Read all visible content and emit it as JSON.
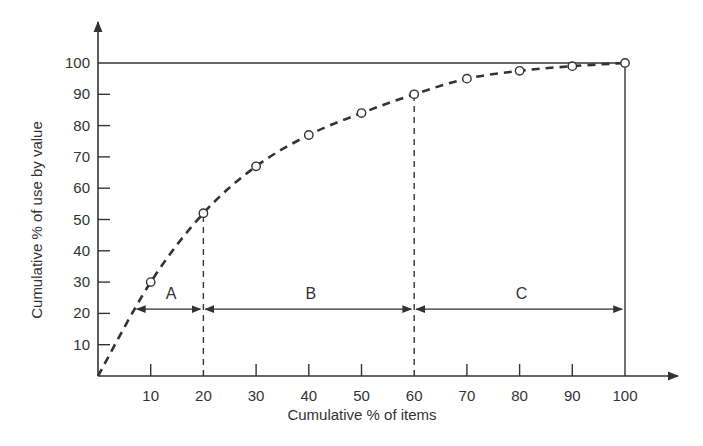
{
  "chart_data": {
    "type": "line",
    "title": "",
    "xlabel": "Cumulative % of items",
    "ylabel": "Cumulative % of use by value",
    "xlim": [
      0,
      100
    ],
    "ylim": [
      0,
      100
    ],
    "grid": false,
    "legend": null,
    "x_ticks": [
      10,
      20,
      30,
      40,
      50,
      60,
      70,
      80,
      90,
      100
    ],
    "y_ticks": [
      10,
      20,
      30,
      40,
      50,
      60,
      70,
      80,
      90,
      100
    ],
    "series": [
      {
        "name": "ABC cumulative curve",
        "style": "dashed with open circle markers",
        "x": [
          10,
          20,
          30,
          40,
          50,
          60,
          70,
          80,
          90,
          100
        ],
        "y": [
          30,
          52,
          67,
          77,
          84,
          90,
          95,
          97.5,
          99,
          100
        ]
      }
    ],
    "reference_lines": [
      {
        "type": "horizontal",
        "y": 100,
        "x_range": [
          0,
          100
        ],
        "style": "solid"
      },
      {
        "type": "vertical",
        "x": 100,
        "y_range": [
          0,
          100
        ],
        "style": "solid"
      },
      {
        "type": "vertical",
        "x": 20,
        "y_range": [
          0,
          52
        ],
        "style": "dashed"
      },
      {
        "type": "vertical",
        "x": 60,
        "y_range": [
          0,
          90
        ],
        "style": "dashed"
      }
    ],
    "annotations": [
      {
        "label": "A",
        "x_range": [
          7,
          20
        ],
        "y": 22,
        "type": "double-arrow"
      },
      {
        "label": "B",
        "x_range": [
          20,
          60
        ],
        "y": 22,
        "type": "double-arrow"
      },
      {
        "label": "C",
        "x_range": [
          60,
          100
        ],
        "y": 22,
        "type": "double-arrow"
      }
    ]
  },
  "colors": {
    "ink": "#333333",
    "background": "#ffffff"
  }
}
